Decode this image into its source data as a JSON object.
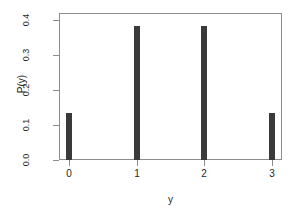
{
  "chart_data": {
    "type": "bar",
    "title": "",
    "subtitle": "",
    "xlabel": "y",
    "ylabel": "P(y)",
    "categories": [
      "0",
      "1",
      "2",
      "3"
    ],
    "x": [
      0,
      1,
      2,
      3
    ],
    "values": [
      0.134,
      0.384,
      0.384,
      0.134
    ],
    "xlim": [
      -0.15,
      3.15
    ],
    "ylim": [
      0.0,
      0.42
    ],
    "xticks": [
      "0",
      "1",
      "2",
      "3"
    ],
    "yticks": [
      "0.0",
      "0.1",
      "0.2",
      "0.3",
      "0.4"
    ],
    "ytick_values": [
      0.0,
      0.1,
      0.2,
      0.3,
      0.4
    ],
    "grid": false,
    "legend": false,
    "bar_color": "#3a3a3a",
    "axis_color": "#8c8c8c",
    "background": "#ffffff",
    "annotations": []
  }
}
